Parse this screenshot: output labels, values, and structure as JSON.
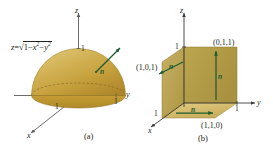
{
  "figure": {
    "panel_a": {
      "caption": "(a)",
      "equation": {
        "lhs": "z",
        "eq": "=",
        "radical": "√",
        "inner_1": "1",
        "minus_1": "−",
        "x": "x",
        "x_exp": "2",
        "minus_2": "−",
        "y": "y",
        "y_exp": "2"
      },
      "axes": {
        "z": "z",
        "y": "y",
        "x": "x"
      },
      "ticks": {
        "z_one": "1",
        "y_one": "1",
        "x_one": "1"
      },
      "normals": [
        {
          "label": "n"
        }
      ],
      "colors": {
        "surface_light": "#d8b855",
        "surface_mid": "#c8a23f",
        "surface_dark": "#a8832c",
        "normal_vector": "#1d5c30",
        "axis": "#5a5a5a"
      }
    },
    "panel_b": {
      "caption": "(b)",
      "axes": {
        "z": "z",
        "y": "y",
        "x": "x"
      },
      "ticks": {
        "z_one": "1",
        "y_one": "1",
        "x_one": "1"
      },
      "point_labels": [
        {
          "name": "left-face-normal-point",
          "text": "(1,0,1)"
        },
        {
          "name": "top-right-face-point",
          "text": "(0,1,1)"
        },
        {
          "name": "bottom-face-point",
          "text": "(1,1,0)"
        }
      ],
      "normals": [
        {
          "name": "left-face-normal",
          "label": "n"
        },
        {
          "name": "vertical-face-normal",
          "label": "n"
        },
        {
          "name": "bottom-face-normal",
          "label": "n"
        }
      ],
      "colors": {
        "face_back": "#bda martial",
        "face_side": "#b9a149",
        "face_bottom": "#d6bc6a",
        "face_vertical": "#b7a04a",
        "normal_vector": "#1d5c30",
        "axis": "#3a3a3a"
      }
    }
  }
}
